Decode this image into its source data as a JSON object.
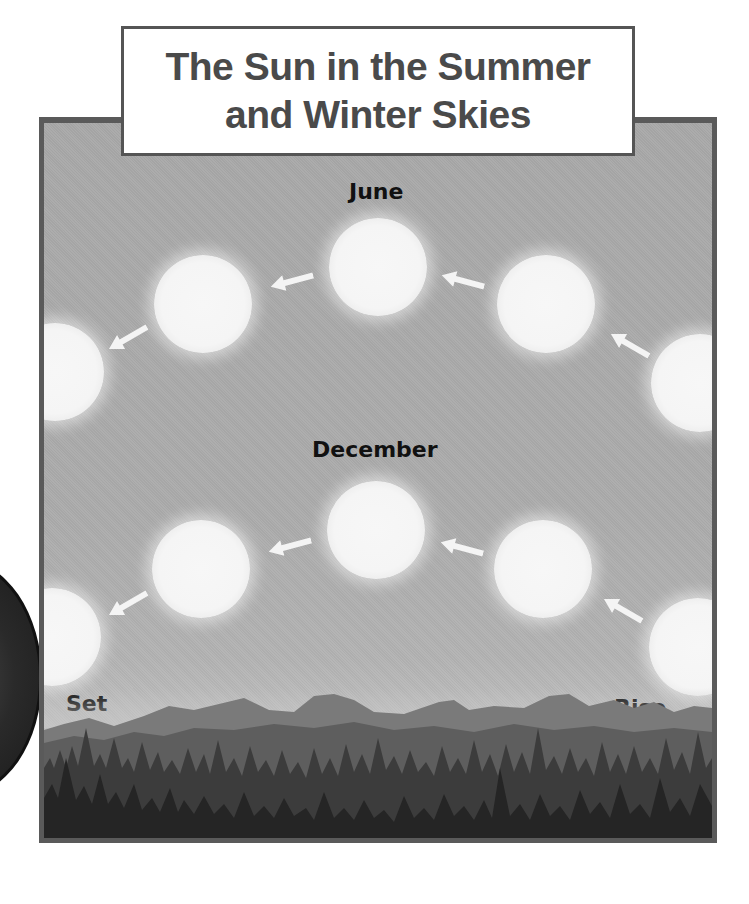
{
  "title": {
    "line1": "The Sun in the Summer",
    "line2": "and Winter Skies"
  },
  "labels": {
    "june": "June",
    "december": "December",
    "set": "Set",
    "rise": "Rise"
  },
  "colors": {
    "sky": "#aaaaaa",
    "sun": "#f5f5f5",
    "frame_border": "#5a5a5a",
    "title_text": "#4a4a4a",
    "label_text": "#111111",
    "trees_dark": "#2e2e2e",
    "mountains": "#6e6e6e"
  },
  "paths": {
    "june": {
      "suns": [
        {
          "x": 700,
          "y": 383
        },
        {
          "x": 546,
          "y": 304
        },
        {
          "x": 378,
          "y": 267
        },
        {
          "x": 203,
          "y": 304
        },
        {
          "x": 55,
          "y": 372
        }
      ],
      "arrows": [
        {
          "x": 630,
          "y": 345,
          "angle": 210
        },
        {
          "x": 463,
          "y": 281,
          "angle": 195
        },
        {
          "x": 292,
          "y": 281,
          "angle": 165
        },
        {
          "x": 128,
          "y": 338,
          "angle": 150
        }
      ]
    },
    "december": {
      "suns": [
        {
          "x": 698,
          "y": 647
        },
        {
          "x": 543,
          "y": 569
        },
        {
          "x": 376,
          "y": 530
        },
        {
          "x": 201,
          "y": 569
        },
        {
          "x": 52,
          "y": 637
        }
      ],
      "arrows": [
        {
          "x": 623,
          "y": 610,
          "angle": 210
        },
        {
          "x": 462,
          "y": 548,
          "angle": 195
        },
        {
          "x": 290,
          "y": 546,
          "angle": 165
        },
        {
          "x": 128,
          "y": 604,
          "angle": 150
        }
      ]
    }
  }
}
